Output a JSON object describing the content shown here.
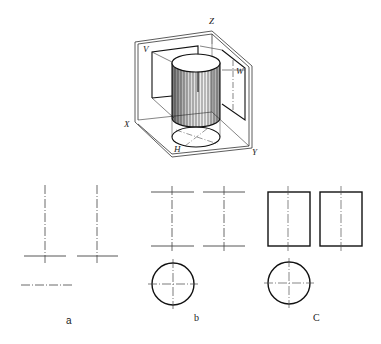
{
  "figure": {
    "isometric": {
      "description": "cylinder in three-projection-plane system",
      "axis_labels": {
        "z": "Z",
        "x": "X",
        "y": "Y"
      },
      "plane_labels": {
        "v": "V",
        "w": "W",
        "h": "H"
      }
    },
    "views": [
      {
        "caption": "a",
        "content": "centerlines only"
      },
      {
        "caption": "b",
        "content": "centerlines, end lines and top-view circle"
      },
      {
        "caption": "C",
        "content": "completed front, side rectangles and top-view circle"
      }
    ]
  },
  "colors": {
    "line": "#1a1a1a",
    "thin": "#555555",
    "background": "#ffffff"
  }
}
